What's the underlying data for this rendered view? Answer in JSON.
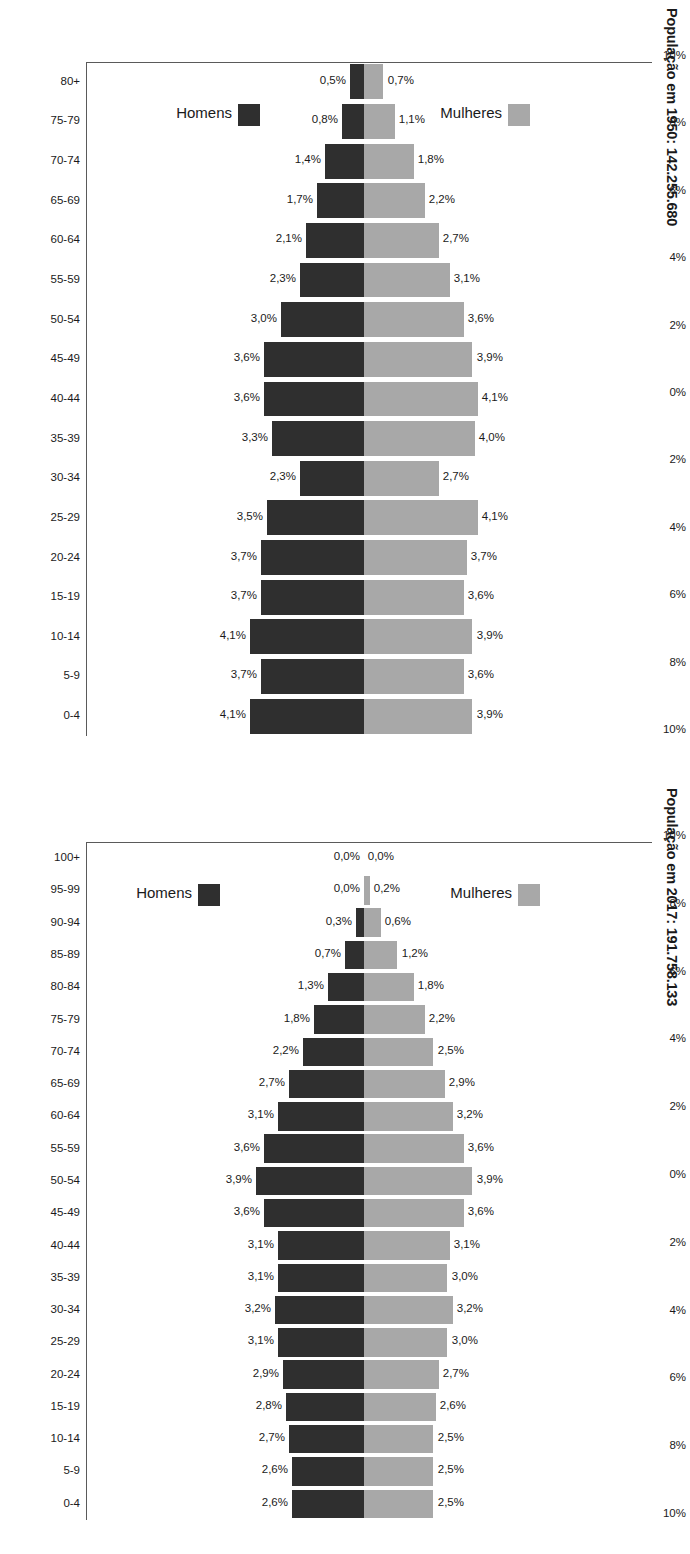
{
  "figure": {
    "kind": "population-pyramid-pair",
    "colors": {
      "men": "#2f2f2f",
      "women": "#a8a8a8",
      "axis": "#5a5a5a",
      "text": "#1a1a1a",
      "background": "#ffffff"
    }
  },
  "panel_1950": {
    "title": "População em 1950: 142.255.680",
    "legend": {
      "men_label": "Homens",
      "women_label": "Mulheres"
    },
    "axis_ticks": [
      "10%",
      "8%",
      "6%",
      "4%",
      "2%",
      "0%",
      "2%",
      "4%",
      "6%",
      "8%",
      "10%"
    ]
  },
  "panel_2017": {
    "title": "População em 2017: 191.758.133",
    "legend": {
      "men_label": "Homens",
      "women_label": "Mulheres"
    },
    "axis_ticks": [
      "10%",
      "8%",
      "6%",
      "4%",
      "2%",
      "0%",
      "2%",
      "4%",
      "6%",
      "8%",
      "10%"
    ]
  },
  "chart_data": [
    {
      "type": "bar",
      "title": "População em 1950: 142.255.680",
      "xlabel": "",
      "ylabel": "",
      "ylim": [
        -10,
        10
      ],
      "axis_tick_labels": [
        "10%",
        "8%",
        "6%",
        "4%",
        "2%",
        "0%",
        "2%",
        "4%",
        "6%",
        "8%",
        "10%"
      ],
      "grid": false,
      "legend_position": "left",
      "categories": [
        "80+",
        "75-79",
        "70-74",
        "65-69",
        "60-64",
        "55-59",
        "50-54",
        "45-49",
        "40-44",
        "35-39",
        "30-34",
        "25-29",
        "20-24",
        "15-19",
        "10-14",
        "5-9",
        "0-4"
      ],
      "series": [
        {
          "name": "Homens",
          "values": [
            0.5,
            0.8,
            1.4,
            1.7,
            2.1,
            2.3,
            3.0,
            3.6,
            3.6,
            3.3,
            2.3,
            3.5,
            3.7,
            3.7,
            4.1,
            3.7,
            4.1
          ],
          "labels": [
            "0,5%",
            "0,8%",
            "1,4%",
            "1,7%",
            "2,1%",
            "2,3%",
            "3,0%",
            "3,6%",
            "3,6%",
            "3,3%",
            "2,3%",
            "3,5%",
            "3,7%",
            "3,7%",
            "4,1%",
            "3,7%",
            "4,1%"
          ]
        },
        {
          "name": "Mulheres",
          "values": [
            0.7,
            1.1,
            1.8,
            2.2,
            2.7,
            3.1,
            3.6,
            3.9,
            4.1,
            4.0,
            2.7,
            4.1,
            3.7,
            3.6,
            3.9,
            3.6,
            3.9
          ],
          "labels": [
            "0,7%",
            "1,1%",
            "1,8%",
            "2,2%",
            "2,7%",
            "3,1%",
            "3,6%",
            "3,9%",
            "4,1%",
            "4,0%",
            "2,7%",
            "4,1%",
            "3,7%",
            "3,6%",
            "3,9%",
            "3,6%",
            "3,9%"
          ]
        }
      ]
    },
    {
      "type": "bar",
      "title": "População em 2017: 191.758.133",
      "xlabel": "",
      "ylabel": "",
      "ylim": [
        -10,
        10
      ],
      "axis_tick_labels": [
        "10%",
        "8%",
        "6%",
        "4%",
        "2%",
        "0%",
        "2%",
        "4%",
        "6%",
        "8%",
        "10%"
      ],
      "grid": false,
      "legend_position": "left",
      "categories": [
        "100+",
        "95-99",
        "90-94",
        "85-89",
        "80-84",
        "75-79",
        "70-74",
        "65-69",
        "60-64",
        "55-59",
        "50-54",
        "45-49",
        "40-44",
        "35-39",
        "30-34",
        "25-29",
        "20-24",
        "15-19",
        "10-14",
        "5-9",
        "0-4"
      ],
      "series": [
        {
          "name": "Homens",
          "values": [
            0.0,
            0.0,
            0.3,
            0.7,
            1.3,
            1.8,
            2.2,
            2.7,
            3.1,
            3.6,
            3.9,
            3.6,
            3.1,
            3.1,
            3.2,
            3.1,
            2.9,
            2.8,
            2.7,
            2.6,
            2.6
          ],
          "labels": [
            "0,0%",
            "0,0%",
            "0,3%",
            "0,7%",
            "1,3%",
            "1,8%",
            "2,2%",
            "2,7%",
            "3,1%",
            "3,6%",
            "3,9%",
            "3,6%",
            "3,1%",
            "3,1%",
            "3,2%",
            "3,1%",
            "2,9%",
            "2,8%",
            "2,7%",
            "2,6%",
            "2,6%"
          ]
        },
        {
          "name": "Mulheres",
          "values": [
            0.0,
            0.2,
            0.6,
            1.2,
            1.8,
            2.2,
            2.5,
            2.9,
            3.2,
            3.6,
            3.9,
            3.6,
            3.1,
            3.0,
            3.2,
            3.0,
            2.7,
            2.6,
            2.5,
            2.5,
            2.5
          ],
          "labels": [
            "0,0%",
            "0,2%",
            "0,6%",
            "1,2%",
            "1,8%",
            "2,2%",
            "2,5%",
            "2,9%",
            "3,2%",
            "3,6%",
            "3,9%",
            "3,6%",
            "3,1%",
            "3,0%",
            "3,2%",
            "3,0%",
            "2,7%",
            "2,6%",
            "2,5%",
            "2,5%",
            "2,5%"
          ]
        }
      ]
    }
  ]
}
